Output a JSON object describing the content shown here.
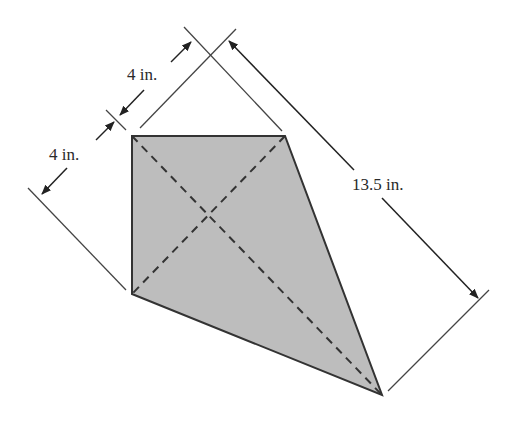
{
  "diagram": {
    "shape": "kite",
    "fill_color": "#bdbdbd",
    "stroke_color": "#333333",
    "vertices": {
      "top_left": [
        132,
        136
      ],
      "top_right": [
        285,
        136
      ],
      "bottom_left": [
        132,
        294
      ],
      "bottom": [
        382,
        395
      ]
    },
    "diagonals": "dashed",
    "dimensions": [
      {
        "id": "upper-4",
        "label": "4 in."
      },
      {
        "id": "lower-4",
        "label": "4 in."
      },
      {
        "id": "long",
        "label": "13.5 in."
      }
    ]
  }
}
